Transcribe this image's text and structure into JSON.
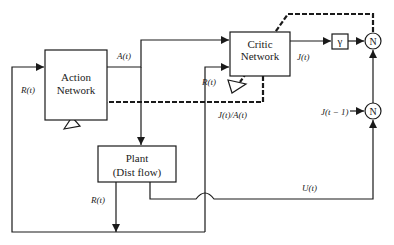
{
  "diagram": {
    "type": "block-diagram",
    "blocks": {
      "action": {
        "line1": "Action",
        "line2": "Network"
      },
      "critic": {
        "line1": "Critic",
        "line2": "Network"
      },
      "plant": {
        "line1": "Plant",
        "line2": "(Dist flow)"
      },
      "gamma": {
        "label": "γ"
      },
      "sum_top": {
        "label": "N"
      },
      "sum_bottom": {
        "label": "N"
      }
    },
    "signals": {
      "r_left": "R(t)",
      "a": "A(t)",
      "r_critic": "R(t)",
      "j": "J(t)",
      "j_prev": "J(t − 1)",
      "dj_da": "J(t)/A(t)",
      "r_plant": "R(t)",
      "u": "U(t)"
    },
    "colors": {
      "line": "#1a1a1a",
      "background": "#ffffff"
    }
  }
}
